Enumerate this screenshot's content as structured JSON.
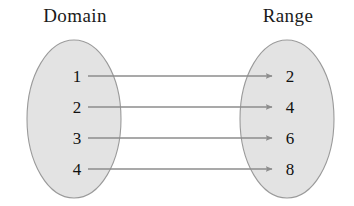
{
  "diagram": {
    "title_domain": "Domain",
    "title_range": "Range",
    "type": "mapping-diagram",
    "background_color": "#ffffff",
    "oval_fill_color": "#e3e3e3",
    "oval_stroke_color": "#9a9a9a",
    "arrow_color": "#8d8d8d",
    "text_color": "#111111",
    "domain": {
      "label": "Domain",
      "label_x": 75,
      "label_y": 22,
      "oval": {
        "cx": 74,
        "cy": 119,
        "rx": 47,
        "ry": 79
      },
      "elements": [
        {
          "value": "1",
          "x": 77,
          "y": 82,
          "anchor_y": 76
        },
        {
          "value": "2",
          "x": 77,
          "y": 113,
          "anchor_y": 107
        },
        {
          "value": "3",
          "x": 77,
          "y": 144,
          "anchor_y": 138
        },
        {
          "value": "4",
          "x": 77,
          "y": 175,
          "anchor_y": 169
        }
      ]
    },
    "range": {
      "label": "Range",
      "label_x": 288,
      "label_y": 22,
      "oval": {
        "cx": 287,
        "cy": 119,
        "rx": 47,
        "ry": 79
      },
      "elements": [
        {
          "value": "2",
          "x": 290,
          "y": 82,
          "anchor_y": 76
        },
        {
          "value": "4",
          "x": 290,
          "y": 113,
          "anchor_y": 107
        },
        {
          "value": "6",
          "x": 290,
          "y": 144,
          "anchor_y": 138
        },
        {
          "value": "8",
          "x": 290,
          "y": 175,
          "anchor_y": 169
        }
      ]
    },
    "mappings": [
      {
        "from": "1",
        "to": "2",
        "x1": 88,
        "y1": 76,
        "x2": 272,
        "y2": 76
      },
      {
        "from": "2",
        "to": "4",
        "x1": 88,
        "y1": 107,
        "x2": 272,
        "y2": 107
      },
      {
        "from": "3",
        "to": "6",
        "x1": 88,
        "y1": 138,
        "x2": 272,
        "y2": 138
      },
      {
        "from": "4",
        "to": "8",
        "x1": 88,
        "y1": 169,
        "x2": 272,
        "y2": 169
      }
    ]
  }
}
